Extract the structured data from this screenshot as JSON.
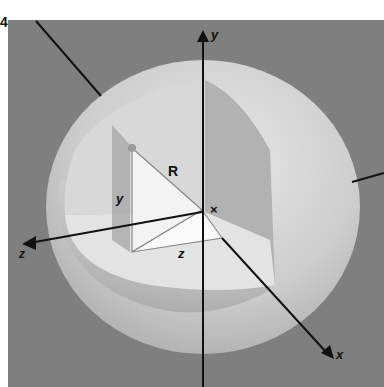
{
  "figure": {
    "number": "4",
    "background_color": "#7f7f7f",
    "sphere_color": "#cfcfcf",
    "cutaway_color": "#e6e6e6"
  },
  "axes": {
    "x_label": "x",
    "y_label": "y",
    "z_label": "z"
  },
  "triangle": {
    "hypotenuse_label": "R",
    "vertical_label": "y",
    "horizontal_label": "z",
    "origin_mark": "×"
  }
}
